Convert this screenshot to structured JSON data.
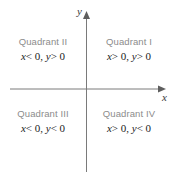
{
  "figure": {
    "background_color": "#ffffff",
    "axis_color": "#7a7a7a",
    "quadrant_label_color": "#8c8c8c",
    "condition_text_color": "#1b1b1b"
  },
  "axes": {
    "y_label": "y",
    "x_label": "x",
    "origin_x": 86,
    "origin_y": 89
  },
  "quadrants": [
    {
      "id": "quadrant-1",
      "name": "Quadrant I",
      "x_condition": "x > 0",
      "y_condition": "y > 0",
      "conditions": "x > 0, y > 0",
      "x_var": "x",
      "x_rel": "> 0,",
      "y_var": "y",
      "y_rel": "> 0"
    },
    {
      "id": "quadrant-2",
      "name": "Quadrant II",
      "x_condition": "x < 0",
      "y_condition": "y > 0",
      "conditions": "x < 0, y > 0",
      "x_var": "x",
      "x_rel": "< 0,",
      "y_var": "y",
      "y_rel": "> 0"
    },
    {
      "id": "quadrant-3",
      "name": "Quadrant III",
      "x_condition": "x < 0",
      "y_condition": "y < 0",
      "conditions": "x < 0, y < 0",
      "x_var": "x",
      "x_rel": "< 0,",
      "y_var": "y",
      "y_rel": "< 0"
    },
    {
      "id": "quadrant-4",
      "name": "Quadrant IV",
      "x_condition": "x > 0",
      "y_condition": "y < 0",
      "conditions": "x > 0, y < 0",
      "x_var": "x",
      "x_rel": "> 0,",
      "y_var": "y",
      "y_rel": "< 0"
    }
  ]
}
